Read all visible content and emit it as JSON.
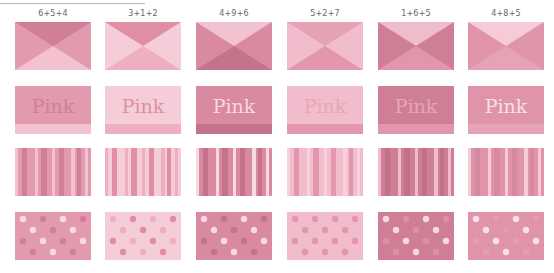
{
  "tiles": [
    {
      "label": "6+5+4",
      "x": {
        "side": "#e29aae",
        "top": "#d07f97",
        "bottom": "#f3c1cf"
      },
      "pink": {
        "bg": "#e29aae",
        "band": "#f3c1cf",
        "text": "#d07f97",
        "word": "Pink"
      },
      "stripes": {
        "base": "#e29aae",
        "accent": "#d07f97",
        "light": "#f3c1cf"
      },
      "dots": {
        "bg": "#e29aae",
        "dot_a": "#f7dae2",
        "dot_b": "#d07f97"
      }
    },
    {
      "label": "3+1+2",
      "x": {
        "side": "#f5cdd8",
        "top": "#e08ea6",
        "bottom": "#eeb0c1"
      },
      "pink": {
        "bg": "#f5cdd8",
        "band": "#eeb0c1",
        "text": "#e08ea6",
        "word": "Pink"
      },
      "stripes": {
        "base": "#f5cdd8",
        "accent": "#e08ea6",
        "light": "#eeb0c1"
      },
      "dots": {
        "bg": "#f5cdd8",
        "dot_a": "#eeb0c1",
        "dot_b": "#e08ea6"
      }
    },
    {
      "label": "4+9+6",
      "x": {
        "side": "#d98aa0",
        "top": "#f1c2cf",
        "bottom": "#c4738b"
      },
      "pink": {
        "bg": "#d98aa0",
        "band": "#c4738b",
        "text": "#f6d9e1",
        "word": "Pink"
      },
      "stripes": {
        "base": "#d98aa0",
        "accent": "#c4738b",
        "light": "#f6d9e1"
      },
      "dots": {
        "bg": "#d98aa0",
        "dot_a": "#f6d9e1",
        "dot_b": "#c4738b"
      }
    },
    {
      "label": "5+2+7",
      "x": {
        "side": "#f1bccb",
        "top": "#e6a2b5",
        "bottom": "#e297ac"
      },
      "pink": {
        "bg": "#f1bccb",
        "band": "#e297ac",
        "text": "#e8a7b9",
        "word": "Pink"
      },
      "stripes": {
        "base": "#f1bccb",
        "accent": "#e297ac",
        "light": "#f6d3dc"
      },
      "dots": {
        "bg": "#f1bccb",
        "dot_a": "#e297ac",
        "dot_b": "#e297ac"
      }
    },
    {
      "label": "1+6+5",
      "x": {
        "side": "#cf7e96",
        "top": "#efbccb",
        "bottom": "#e096ab"
      },
      "pink": {
        "bg": "#cf7e96",
        "band": "#e096ab",
        "text": "#e6a5b7",
        "word": "Pink"
      },
      "stripes": {
        "base": "#cf7e96",
        "accent": "#c2718a",
        "light": "#efbccb"
      },
      "dots": {
        "bg": "#cf7e96",
        "dot_a": "#f6d8e0",
        "dot_b": "#dc8fa5"
      }
    },
    {
      "label": "4+8+5",
      "x": {
        "side": "#df94a9",
        "top": "#f4cbd6",
        "bottom": "#e6a3b6"
      },
      "pink": {
        "bg": "#df94a9",
        "band": "#e6a3b6",
        "text": "#f8e0e7",
        "word": "Pink"
      },
      "stripes": {
        "base": "#df94a9",
        "accent": "#d68aa0",
        "light": "#f4cbd6"
      },
      "dots": {
        "bg": "#df94a9",
        "dot_a": "#f8e0e7",
        "dot_b": "#e39cb0"
      }
    }
  ],
  "layout": {
    "column_x": [
      15,
      105,
      196,
      287,
      378,
      468
    ]
  }
}
